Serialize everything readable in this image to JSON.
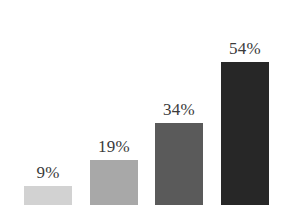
{
  "chart_data": {
    "type": "bar",
    "title": "",
    "subtitle": "",
    "xlabel": "",
    "ylabel": "",
    "categories": [
      "",
      "",
      "",
      ""
    ],
    "values": [
      9,
      19,
      34,
      54
    ],
    "data_labels": [
      "9%",
      "19%",
      "34%",
      "54%"
    ],
    "bar_colors": [
      "#d2d2d2",
      "#a8a8a8",
      "#5a5a5a",
      "#272727"
    ],
    "label_color": "#3b3b3b",
    "background_color": "#ffffff",
    "ylim": [
      0,
      60
    ],
    "grid": false,
    "axes_visible": false,
    "legend": false,
    "legend_position": "none",
    "tick_labels": [],
    "annotations": [],
    "bars": [
      {
        "label": "9%",
        "value": 9,
        "color": "#d2d2d2",
        "height_px": 19
      },
      {
        "label": "19%",
        "value": 19,
        "color": "#a8a8a8",
        "height_px": 45
      },
      {
        "label": "34%",
        "value": 34,
        "color": "#5a5a5a",
        "height_px": 82
      },
      {
        "label": "54%",
        "value": 54,
        "color": "#272727",
        "height_px": 143
      }
    ]
  }
}
